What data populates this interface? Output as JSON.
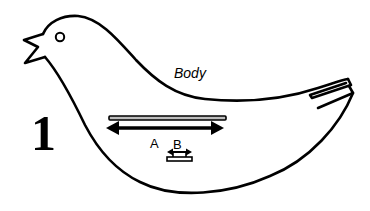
{
  "figure": {
    "step_number": "1",
    "part_label": "Body",
    "dimension_a_label": "A",
    "dimension_b_label": "B",
    "colors": {
      "line": "#000000",
      "background": "#ffffff",
      "bar_fill": "#bdbdbd"
    }
  }
}
